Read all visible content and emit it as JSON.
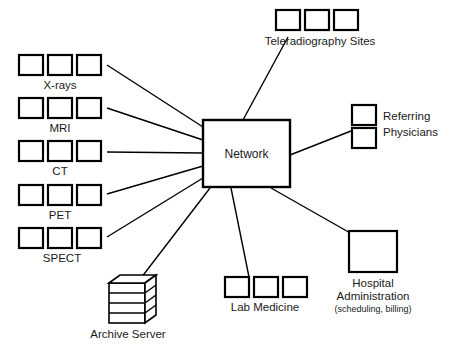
{
  "diagram": {
    "background_color": "#ffffff",
    "line_color": "#000000",
    "hub": {
      "label": "Network",
      "x": 203,
      "y": 120,
      "width": 87,
      "height": 67
    },
    "modalities": [
      {
        "label": "X-rays",
        "box_count": 3,
        "row_y": 55
      },
      {
        "label": "MRI",
        "box_count": 3,
        "row_y": 98
      },
      {
        "label": "CT",
        "box_count": 3,
        "row_y": 141
      },
      {
        "label": "PET",
        "box_count": 3,
        "row_y": 185
      },
      {
        "label": "SPECT",
        "box_count": 3,
        "row_y": 228
      }
    ],
    "nodes": [
      {
        "name": "teleradiography-sites",
        "label": "Teleradiography Sites",
        "box_count": 3,
        "orientation": "horizontal"
      },
      {
        "name": "referring-physicians",
        "label": "Referring Physicians",
        "label_line_1": "Referring",
        "label_line_2": "Physicians",
        "box_count": 2,
        "orientation": "vertical"
      },
      {
        "name": "hospital-administration",
        "label": "Hospital Administration",
        "label_line_1": "Hospital",
        "label_line_2": "Administration",
        "sub_label": "(scheduling, billing)",
        "box_count": 1,
        "orientation": "single"
      },
      {
        "name": "lab-medicine",
        "label": "Lab Medicine",
        "box_count": 3,
        "orientation": "horizontal"
      },
      {
        "name": "archive-server",
        "label": "Archive Server",
        "box_count": 1,
        "orientation": "stack",
        "shelf_count": 4
      }
    ]
  }
}
